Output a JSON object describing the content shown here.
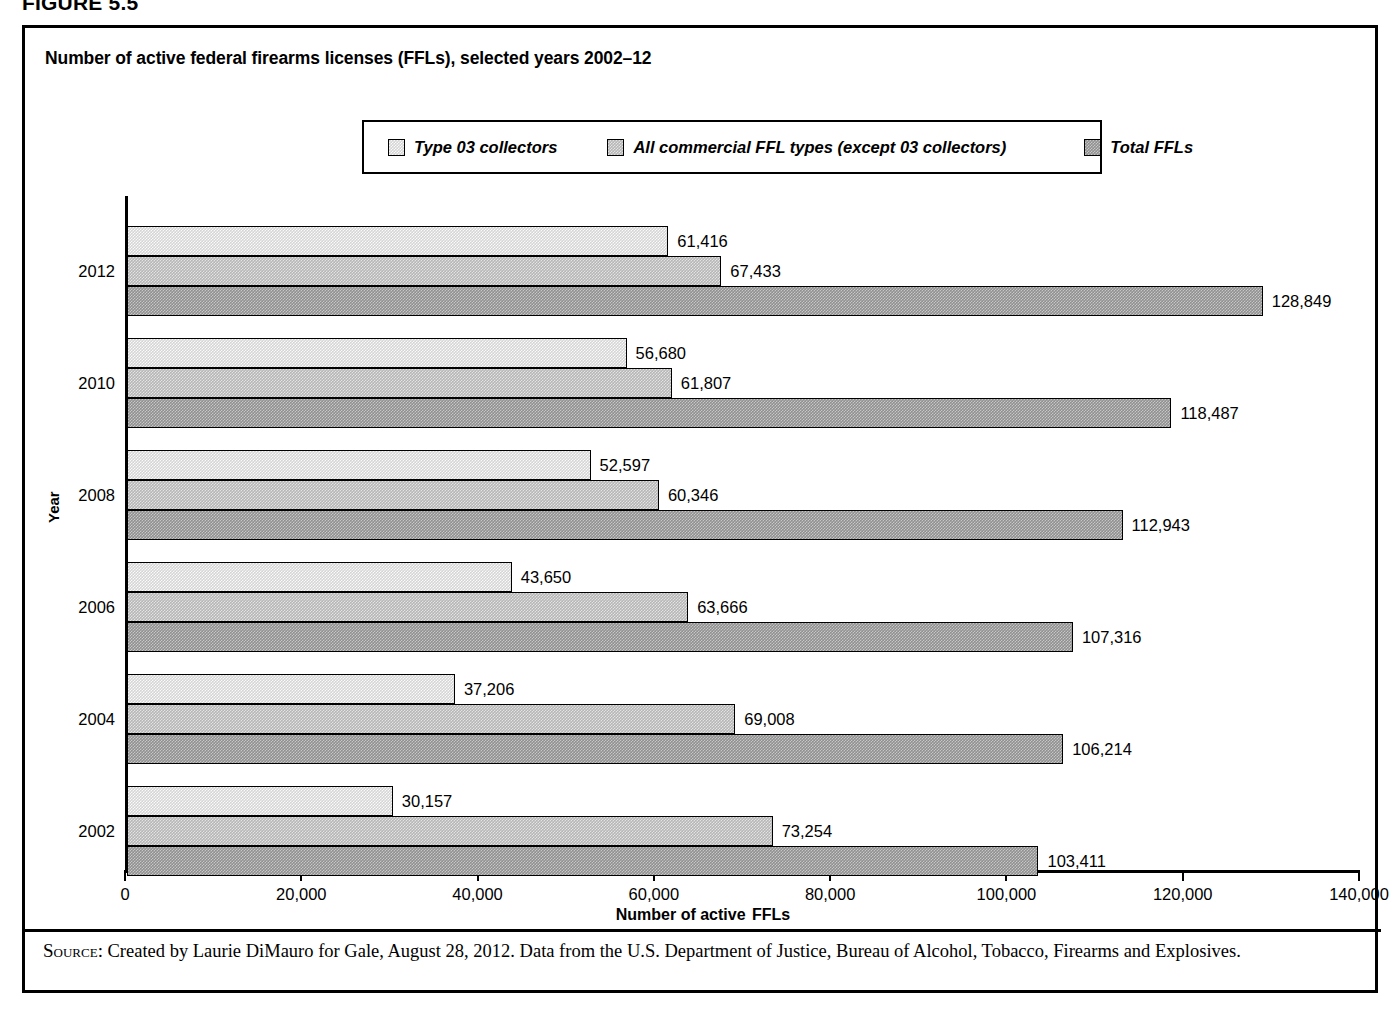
{
  "figure": {
    "label": "FIGURE 5.5",
    "title": "Number of active federal firearms licenses (FFLs), selected years 2002–12"
  },
  "legend": {
    "items": [
      {
        "label": "Type 03 collectors",
        "swatch": "light-checker-swatch",
        "color": "#d5d5d5"
      },
      {
        "label": "All commercial FFL types (except 03 collectors)",
        "swatch": "mid-checker-swatch",
        "color": "#b6b6b6"
      },
      {
        "label": "Total FFLs",
        "swatch": "dark-checker-swatch",
        "color": "#909090"
      }
    ]
  },
  "axes": {
    "x_title_part1": "Number of active",
    "x_title_part2": "FFLs",
    "y_title": "Year",
    "x_ticks": [
      "0",
      "20,000",
      "40,000",
      "60,000",
      "80,000",
      "100,000",
      "120,000",
      "140,000"
    ]
  },
  "source": {
    "label": "Source:",
    "text": " Created by Laurie DiMauro for Gale, August 28, 2012. Data from the U.S. Department of Justice, Bureau of Alcohol, Tobacco, Firearms and Explosives."
  },
  "chart_data": {
    "type": "bar",
    "orientation": "horizontal",
    "title": "Number of active federal firearms licenses (FFLs), selected years 2002–12",
    "xlabel": "Number of active FFLs",
    "ylabel": "Year",
    "xlim": [
      0,
      140000
    ],
    "xtick_step": 20000,
    "grid": false,
    "legend_position": "top",
    "categories": [
      "2012",
      "2010",
      "2008",
      "2006",
      "2004",
      "2002"
    ],
    "series": [
      {
        "name": "Type 03 collectors",
        "values": [
          61416,
          56680,
          52597,
          43650,
          37206,
          30157
        ],
        "labels": [
          "61,416",
          "56,680",
          "52,597",
          "43,650",
          "37,206",
          "30,157"
        ]
      },
      {
        "name": "All commercial FFL types (except 03 collectors)",
        "values": [
          67433,
          61807,
          60346,
          63666,
          69008,
          73254
        ],
        "labels": [
          "67,433",
          "61,807",
          "60,346",
          "63,666",
          "69,008",
          "73,254"
        ]
      },
      {
        "name": "Total FFLs",
        "values": [
          128849,
          118487,
          112943,
          107316,
          106214,
          103411
        ],
        "labels": [
          "128,849",
          "118,487",
          "112,943",
          "107,316",
          "106,214",
          "103,411"
        ]
      }
    ]
  }
}
